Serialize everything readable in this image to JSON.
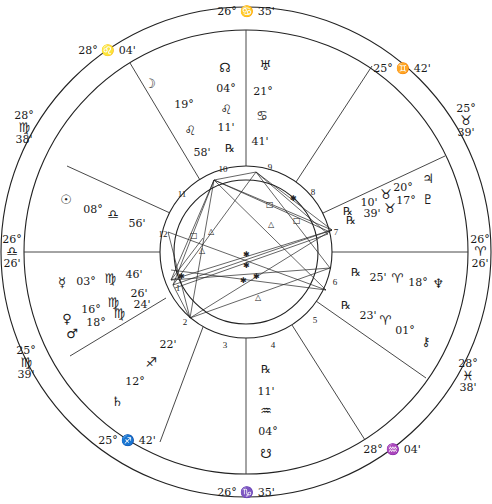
{
  "cusps": [
    {
      "house": 10,
      "deg": "26°",
      "sign": "♋",
      "min": "35'",
      "x": 246,
      "y": 11
    },
    {
      "house": 11,
      "deg": "25°",
      "sign": "♊",
      "min": "42'",
      "x": 402,
      "y": 68
    },
    {
      "house": 12,
      "deg": "25°",
      "sign": "♉",
      "min": "39'",
      "x": 466,
      "y": 121
    },
    {
      "house": 1,
      "deg": "26°",
      "sign": "♈",
      "min": "26'",
      "x": 480,
      "y": 252
    },
    {
      "house": 2,
      "deg": "28°",
      "sign": "♓",
      "min": "38'",
      "x": 468,
      "y": 376
    },
    {
      "house": 3,
      "deg": "28°",
      "sign": "♒",
      "min": "04'",
      "x": 392,
      "y": 449
    },
    {
      "house": 4,
      "deg": "26°",
      "sign": "♑",
      "min": "35'",
      "x": 246,
      "y": 492
    },
    {
      "house": 5,
      "deg": "25°",
      "sign": "♐",
      "min": "42'",
      "x": 127,
      "y": 440
    },
    {
      "house": 6,
      "deg": "25°",
      "sign": "♍",
      "min": "39'",
      "x": 26,
      "y": 363
    },
    {
      "house": 7,
      "deg": "26°",
      "sign": "♎",
      "min": "26'",
      "x": 12,
      "y": 252
    },
    {
      "house": 8,
      "deg": "28°",
      "sign": "♍",
      "min": "38'",
      "x": 24,
      "y": 128
    },
    {
      "house": 9,
      "deg": "28°",
      "sign": "♌",
      "min": "04'",
      "x": 107,
      "y": 50
    }
  ],
  "planets": [
    {
      "name": "Moon",
      "glyph": "☽",
      "deg": "19°",
      "sign": "♌",
      "min": "58'",
      "retro": ""
    },
    {
      "name": "North Node",
      "glyph": "☊",
      "deg": "04°",
      "sign": "♌",
      "min": "11'",
      "retro": "℞"
    },
    {
      "name": "Uranus",
      "glyph": "♅",
      "deg": "21°",
      "sign": "♋",
      "min": "41'",
      "retro": ""
    },
    {
      "name": "Jupiter",
      "glyph": "♃",
      "deg": "20°",
      "sign": "♉",
      "min": "10'",
      "retro": "℞"
    },
    {
      "name": "Pluto",
      "glyph": "♇",
      "deg": "17°",
      "sign": "♉",
      "min": "39'",
      "retro": "℞"
    },
    {
      "name": "Neptune",
      "glyph": "♆",
      "deg": "18°",
      "sign": "♈",
      "min": "25'",
      "retro": "℞"
    },
    {
      "name": "Chiron",
      "glyph": "⚷",
      "deg": "01°",
      "sign": "♈",
      "min": "23'",
      "retro": "℞"
    },
    {
      "name": "South Node",
      "glyph": "☋",
      "deg": "04°",
      "sign": "♒",
      "min": "11'",
      "retro": "℞"
    },
    {
      "name": "Saturn",
      "glyph": "♄",
      "deg": "12°",
      "sign": "♐",
      "min": "22'",
      "retro": ""
    },
    {
      "name": "Venus",
      "glyph": "♀",
      "deg": "16°",
      "sign": "♍",
      "min": "26'",
      "retro": ""
    },
    {
      "name": "Mars",
      "glyph": "♂",
      "deg": "18°",
      "sign": "♍",
      "min": "24'",
      "retro": ""
    },
    {
      "name": "Mercury",
      "glyph": "☿",
      "deg": "03°",
      "sign": "♍",
      "min": "46'",
      "retro": ""
    },
    {
      "name": "Sun",
      "glyph": "☉",
      "deg": "08°",
      "sign": "♎",
      "min": "56'",
      "retro": ""
    }
  ],
  "house_numbers": [
    "1",
    "2",
    "3",
    "4",
    "5",
    "6",
    "7",
    "8",
    "9",
    "10",
    "11",
    "12"
  ],
  "labels": [
    {
      "id": "moon-glyph",
      "text": "☽",
      "x": 150,
      "y": 83,
      "g": true
    },
    {
      "id": "moon-deg",
      "text": "19°",
      "x": 184,
      "y": 104
    },
    {
      "id": "moon-sign",
      "text": "♌",
      "x": 190,
      "y": 130,
      "g": true
    },
    {
      "id": "moon-min",
      "text": "58'",
      "x": 202,
      "y": 152
    },
    {
      "id": "nnode-glyph",
      "text": "☊",
      "x": 225,
      "y": 67,
      "g": true
    },
    {
      "id": "nnode-deg",
      "text": "04°",
      "x": 226,
      "y": 88
    },
    {
      "id": "nnode-sign",
      "text": "♌",
      "x": 226,
      "y": 109,
      "g": true
    },
    {
      "id": "nnode-min",
      "text": "11'",
      "x": 226,
      "y": 127
    },
    {
      "id": "nnode-retro",
      "text": "℞",
      "x": 230,
      "y": 148
    },
    {
      "id": "uranus-glyph",
      "text": "♅",
      "x": 265,
      "y": 65,
      "g": true
    },
    {
      "id": "uranus-deg",
      "text": "21°",
      "x": 263,
      "y": 91
    },
    {
      "id": "uranus-sign",
      "text": "♋",
      "x": 262,
      "y": 115,
      "g": true
    },
    {
      "id": "uranus-min",
      "text": "41'",
      "x": 260,
      "y": 141
    },
    {
      "id": "jupiter-glyph",
      "text": "♃",
      "x": 428,
      "y": 178,
      "g": true
    },
    {
      "id": "jupiter-deg",
      "text": "20°",
      "x": 403,
      "y": 187
    },
    {
      "id": "jupiter-sign",
      "text": "♉",
      "x": 386,
      "y": 194,
      "g": true
    },
    {
      "id": "jupiter-min",
      "text": "10'",
      "x": 369,
      "y": 202
    },
    {
      "id": "jupiter-retro",
      "text": "℞",
      "x": 348,
      "y": 211
    },
    {
      "id": "pluto-glyph",
      "text": "♇",
      "x": 428,
      "y": 199,
      "g": true
    },
    {
      "id": "pluto-deg",
      "text": "17°",
      "x": 406,
      "y": 200
    },
    {
      "id": "pluto-sign",
      "text": "♉",
      "x": 390,
      "y": 208,
      "g": true
    },
    {
      "id": "pluto-min",
      "text": "39'",
      "x": 372,
      "y": 213
    },
    {
      "id": "pluto-retro",
      "text": "℞",
      "x": 351,
      "y": 220
    },
    {
      "id": "neptune-retro",
      "text": "℞",
      "x": 356,
      "y": 272
    },
    {
      "id": "neptune-min",
      "text": "25'",
      "x": 378,
      "y": 277
    },
    {
      "id": "neptune-sign",
      "text": "♈",
      "x": 397,
      "y": 278,
      "g": true
    },
    {
      "id": "neptune-deg",
      "text": "18°",
      "x": 418,
      "y": 282
    },
    {
      "id": "neptune-glyph",
      "text": "♆",
      "x": 438,
      "y": 283,
      "g": true
    },
    {
      "id": "chiron-retro",
      "text": "℞",
      "x": 346,
      "y": 305
    },
    {
      "id": "chiron-min",
      "text": "23'",
      "x": 368,
      "y": 315
    },
    {
      "id": "chiron-sign",
      "text": "♈",
      "x": 385,
      "y": 320,
      "g": true
    },
    {
      "id": "chiron-deg",
      "text": "01°",
      "x": 405,
      "y": 330
    },
    {
      "id": "chiron-glyph",
      "text": "⚷",
      "x": 426,
      "y": 341,
      "g": true
    },
    {
      "id": "snode-retro",
      "text": "℞",
      "x": 266,
      "y": 369
    },
    {
      "id": "snode-min",
      "text": "11'",
      "x": 266,
      "y": 391
    },
    {
      "id": "snode-sign",
      "text": "♒",
      "x": 266,
      "y": 410,
      "g": true
    },
    {
      "id": "snode-deg",
      "text": "04°",
      "x": 268,
      "y": 431
    },
    {
      "id": "snode-glyph",
      "text": "☋",
      "x": 266,
      "y": 453,
      "g": true
    },
    {
      "id": "saturn-min",
      "text": "22'",
      "x": 168,
      "y": 344
    },
    {
      "id": "saturn-sign",
      "text": "♐",
      "x": 151,
      "y": 362,
      "g": true
    },
    {
      "id": "saturn-deg",
      "text": "12°",
      "x": 135,
      "y": 381
    },
    {
      "id": "saturn-glyph",
      "text": "♄",
      "x": 117,
      "y": 401,
      "g": true
    },
    {
      "id": "mercury-glyph",
      "text": "☿",
      "x": 62,
      "y": 282,
      "g": true
    },
    {
      "id": "mercury-deg",
      "text": "03°",
      "x": 86,
      "y": 281
    },
    {
      "id": "mercury-sign",
      "text": "♍",
      "x": 110,
      "y": 278,
      "g": true
    },
    {
      "id": "mercury-min",
      "text": "46'",
      "x": 134,
      "y": 274
    },
    {
      "id": "venus-min",
      "text": "26'",
      "x": 139,
      "y": 293
    },
    {
      "id": "mars-min",
      "text": "24'",
      "x": 142,
      "y": 304
    },
    {
      "id": "venus-sign",
      "text": "♍",
      "x": 113,
      "y": 302,
      "g": true
    },
    {
      "id": "mars-sign",
      "text": "♍",
      "x": 119,
      "y": 313,
      "g": true
    },
    {
      "id": "venus-deg",
      "text": "16°",
      "x": 91,
      "y": 309
    },
    {
      "id": "mars-deg",
      "text": "18°",
      "x": 96,
      "y": 322
    },
    {
      "id": "venus-glyph",
      "text": "♀",
      "x": 67,
      "y": 318,
      "g": true
    },
    {
      "id": "mars-glyph",
      "text": "♂",
      "x": 72,
      "y": 333,
      "g": true
    },
    {
      "id": "sun-glyph",
      "text": "☉",
      "x": 66,
      "y": 199,
      "g": true
    },
    {
      "id": "sun-deg",
      "text": "08°",
      "x": 93,
      "y": 209
    },
    {
      "id": "sun-sign",
      "text": "♎",
      "x": 113,
      "y": 214,
      "g": true
    },
    {
      "id": "sun-min",
      "text": "56'",
      "x": 137,
      "y": 223
    }
  ]
}
